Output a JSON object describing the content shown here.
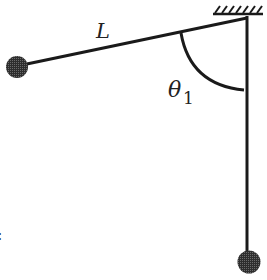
{
  "diagram": {
    "labels": {
      "length": "L",
      "angle_symbol": "θ",
      "angle_subscript": "1",
      "edge_mark": ":"
    },
    "elements": {
      "ceiling": "hatched-support",
      "pivot": "pivot-point",
      "string_displaced": "string-at-angle",
      "string_vertical": "string-at-rest",
      "bob_displaced": "bob-initial-position",
      "bob_vertical": "bob-lowest-position",
      "angle_arc": "angle-arc"
    },
    "colors": {
      "line": "#1a1a1a",
      "bob": "#3a3a3a",
      "background": "#ffffff"
    }
  }
}
